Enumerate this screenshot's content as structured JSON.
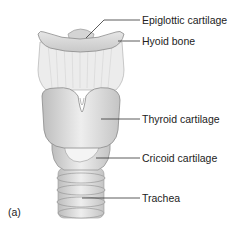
{
  "figure": {
    "panel_label": "(a)",
    "labels": [
      {
        "text": "Epiglottic cartilage"
      },
      {
        "text": "Hyoid bone"
      },
      {
        "text": "Thyroid cartilage"
      },
      {
        "text": "Cricoid cartilage"
      },
      {
        "text": "Trachea"
      }
    ]
  }
}
